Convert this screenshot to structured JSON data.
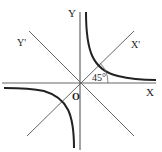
{
  "diagram": {
    "type": "rectangular hyperbola with rotated axes",
    "labels": {
      "y_axis": "Y",
      "x_axis": "X",
      "y_prime": "Y'",
      "x_prime": "X'",
      "origin": "O",
      "angle": "45°"
    },
    "colors": {
      "line": "#555555",
      "curve": "#222222",
      "background": "#ffffff"
    }
  }
}
